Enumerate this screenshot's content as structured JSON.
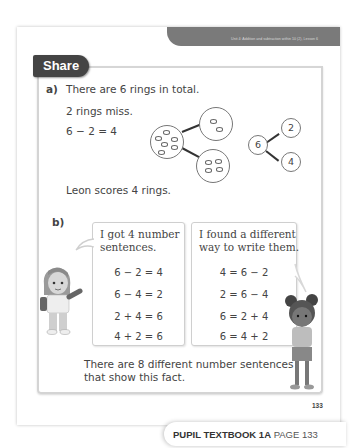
{
  "header": {
    "unit_text": "Unit 4: Addition and subtraction within 10 (2), Lesson 6"
  },
  "section_tab": "Share",
  "part_a": {
    "label": "a)",
    "line1": "There are 6 rings in total.",
    "line2": "2 rings miss.",
    "equation": "6 − 2 = 4",
    "conclusion": "Leon scores 4 rings.",
    "part_whole": {
      "whole": "6",
      "part1": "2",
      "part2": "4"
    }
  },
  "part_b": {
    "label": "b)",
    "left_bubble": {
      "heading": [
        "I got 4 number",
        "sentences."
      ],
      "equations": [
        "6 − 2 = 4",
        "6 − 4 = 2",
        "2 + 4 = 6",
        "4 + 2 = 6"
      ]
    },
    "right_bubble": {
      "heading": [
        "I found a different",
        "way to write them."
      ],
      "equations": [
        "4 = 6 − 2",
        "2 = 6 − 4",
        "6 = 2 + 4",
        "6 = 4 + 2"
      ]
    },
    "conclusion": [
      "There are 8 different number sentences",
      "that show this fact."
    ]
  },
  "page_number": "133",
  "footer": {
    "book": "PUPIL TEXTBOOK 1A",
    "page": "PAGE 133"
  }
}
